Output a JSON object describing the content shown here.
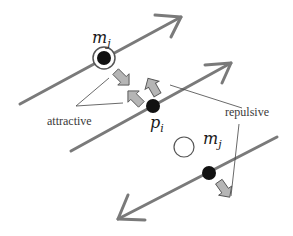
{
  "diagram": {
    "labels": {
      "m_top": "m",
      "m_top_sub": "j",
      "p": "p",
      "p_sub": "i",
      "m_bottom": "m",
      "m_bottom_sub": "j",
      "attractive": "attractive",
      "repulsive": "repulsive"
    },
    "colors": {
      "line": "#7a7a7a",
      "force_arrow_fill": "#b5b5b5",
      "force_arrow_stroke": "#555555",
      "point": "#111111",
      "leader": "#444444"
    },
    "elements": [
      {
        "type": "directed-line",
        "id": "line-top",
        "direction": "up-right"
      },
      {
        "type": "directed-line",
        "id": "line-middle",
        "direction": "up-right"
      },
      {
        "type": "directed-line",
        "id": "line-bottom",
        "direction": "down-left"
      },
      {
        "type": "point",
        "id": "m_j_top",
        "style": "filled-with-ring"
      },
      {
        "type": "point",
        "id": "p_i",
        "style": "filled"
      },
      {
        "type": "point",
        "id": "m_j_bottom",
        "style": "filled"
      },
      {
        "type": "point",
        "id": "m_j_bottom_projection",
        "style": "open-circle"
      },
      {
        "type": "force-arrow",
        "kind": "attractive",
        "count": 3
      },
      {
        "type": "force-arrow",
        "kind": "repulsive",
        "count": 1
      }
    ]
  }
}
